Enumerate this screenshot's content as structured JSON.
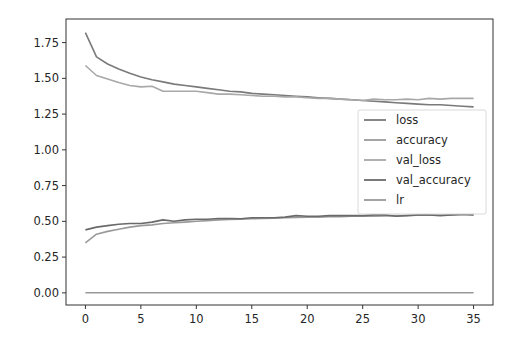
{
  "chart_data": {
    "type": "line",
    "title": "",
    "xlabel": "",
    "ylabel": "",
    "xlim": [
      -1.75,
      36.75
    ],
    "ylim": [
      -0.085,
      1.915
    ],
    "grid": false,
    "legend_position": "center right",
    "x_ticks": [
      0,
      5,
      10,
      15,
      20,
      25,
      30,
      35
    ],
    "x_tick_labels": [
      "0",
      "5",
      "10",
      "15",
      "20",
      "25",
      "30",
      "35"
    ],
    "y_ticks": [
      0.0,
      0.25,
      0.5,
      0.75,
      1.0,
      1.25,
      1.5,
      1.75
    ],
    "y_tick_labels": [
      "0.00",
      "0.25",
      "0.50",
      "0.75",
      "1.00",
      "1.25",
      "1.50",
      "1.75"
    ],
    "x": [
      0,
      1,
      2,
      3,
      4,
      5,
      6,
      7,
      8,
      9,
      10,
      11,
      12,
      13,
      14,
      15,
      16,
      17,
      18,
      19,
      20,
      21,
      22,
      23,
      24,
      25,
      26,
      27,
      28,
      29,
      30,
      31,
      32,
      33,
      34,
      35
    ],
    "series": [
      {
        "name": "loss",
        "color": "#7a7a7a",
        "values": [
          1.82,
          1.65,
          1.6,
          1.565,
          1.535,
          1.51,
          1.49,
          1.475,
          1.46,
          1.45,
          1.44,
          1.43,
          1.42,
          1.41,
          1.405,
          1.395,
          1.39,
          1.385,
          1.38,
          1.375,
          1.37,
          1.365,
          1.36,
          1.355,
          1.35,
          1.345,
          1.34,
          1.335,
          1.33,
          1.325,
          1.32,
          1.315,
          1.315,
          1.31,
          1.305,
          1.3
        ]
      },
      {
        "name": "accuracy",
        "color": "#9a9a9a",
        "values": [
          0.35,
          0.41,
          0.43,
          0.445,
          0.46,
          0.47,
          0.475,
          0.485,
          0.49,
          0.495,
          0.5,
          0.505,
          0.51,
          0.513,
          0.515,
          0.518,
          0.52,
          0.523,
          0.525,
          0.527,
          0.528,
          0.53,
          0.532,
          0.533,
          0.535,
          0.536,
          0.537,
          0.538,
          0.54,
          0.541,
          0.542,
          0.543,
          0.544,
          0.545,
          0.546,
          0.547
        ]
      },
      {
        "name": "val_loss",
        "color": "#a8a8a8",
        "values": [
          1.59,
          1.52,
          1.495,
          1.47,
          1.45,
          1.44,
          1.445,
          1.41,
          1.41,
          1.41,
          1.41,
          1.4,
          1.39,
          1.39,
          1.385,
          1.38,
          1.375,
          1.375,
          1.37,
          1.37,
          1.365,
          1.36,
          1.36,
          1.355,
          1.35,
          1.345,
          1.355,
          1.35,
          1.35,
          1.355,
          1.35,
          1.36,
          1.355,
          1.36,
          1.36,
          1.36
        ]
      },
      {
        "name": "val_accuracy",
        "color": "#6a6a6a",
        "values": [
          0.44,
          0.46,
          0.47,
          0.48,
          0.485,
          0.485,
          0.495,
          0.51,
          0.5,
          0.51,
          0.515,
          0.515,
          0.52,
          0.52,
          0.518,
          0.525,
          0.525,
          0.525,
          0.53,
          0.54,
          0.535,
          0.535,
          0.54,
          0.54,
          0.54,
          0.54,
          0.545,
          0.545,
          0.535,
          0.54,
          0.545,
          0.545,
          0.54,
          0.545,
          0.55,
          0.545
        ]
      },
      {
        "name": "lr",
        "color": "#999999",
        "values": [
          0.001,
          0.001,
          0.001,
          0.001,
          0.001,
          0.001,
          0.001,
          0.001,
          0.001,
          0.001,
          0.001,
          0.001,
          0.001,
          0.001,
          0.001,
          0.001,
          0.001,
          0.001,
          0.001,
          0.001,
          0.001,
          0.001,
          0.001,
          0.001,
          0.001,
          0.001,
          0.001,
          0.001,
          0.001,
          0.001,
          0.001,
          0.001,
          0.001,
          0.001,
          0.001,
          0.001
        ]
      }
    ],
    "legend": [
      "loss",
      "accuracy",
      "val_loss",
      "val_accuracy",
      "lr"
    ]
  },
  "layout": {
    "plot_left": 66,
    "plot_right": 493,
    "plot_top": 19,
    "plot_bottom": 305,
    "frame_color": "#333333",
    "tick_color": "#333333",
    "legend_box": {
      "x": 358,
      "y": 110,
      "w": 128,
      "h": 104
    }
  }
}
